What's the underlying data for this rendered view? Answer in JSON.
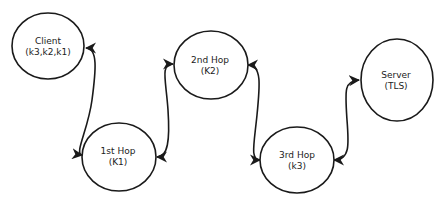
{
  "diagram": {
    "type": "onion-routing-chain",
    "stroke_color": "#1a1a1a",
    "background": "#ffffff",
    "nodes": [
      {
        "id": "client",
        "title": "Client",
        "subtitle": "(k3,k2,k1)"
      },
      {
        "id": "hop1",
        "title": "1st Hop",
        "subtitle": "(K1)"
      },
      {
        "id": "hop2",
        "title": "2nd Hop",
        "subtitle": "(K2)"
      },
      {
        "id": "hop3",
        "title": "3rd Hop",
        "subtitle": "(k3)"
      },
      {
        "id": "server",
        "title": "Server",
        "subtitle": "(TLS)"
      }
    ],
    "edges": [
      {
        "from": "client",
        "to": "hop1",
        "bidirectional": true
      },
      {
        "from": "hop1",
        "to": "hop2",
        "bidirectional": true
      },
      {
        "from": "hop2",
        "to": "hop3",
        "bidirectional": true
      },
      {
        "from": "hop3",
        "to": "server",
        "bidirectional": true
      }
    ]
  }
}
